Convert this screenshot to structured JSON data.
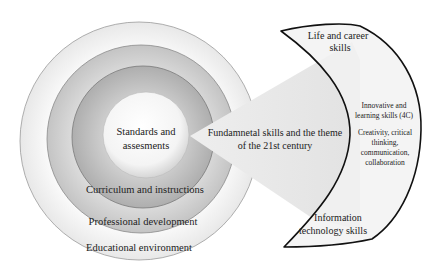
{
  "diagram": {
    "rings": [
      {
        "id": "educational-environment",
        "label": "Educational environment"
      },
      {
        "id": "professional-development",
        "label": "Professional development"
      },
      {
        "id": "curriculum",
        "label": "Curriculum and instructions"
      },
      {
        "id": "standards",
        "label_line1": "Standards and",
        "label_line2": "assesments"
      }
    ],
    "wedge": {
      "label_line1": "Fundamnetal skills and the theme",
      "label_line2": "of the 21st century"
    },
    "crescent": {
      "top_line1": "Life and career",
      "top_line2": "skills",
      "middle_heading_line1": "Innovative and",
      "middle_heading_line2": "learning skills (4C)",
      "middle_body_line1": "Creativity, critical",
      "middle_body_line2": "thinking,",
      "middle_body_line3": "communication,",
      "middle_body_line4": "collaboration",
      "bottom_line1": "Information",
      "bottom_line2": "technology skills"
    },
    "colors": {
      "outer_ring": "#f4f4f4",
      "ring2": "#cfcfcf",
      "ring3": "#b9b9b9",
      "inner": "#f7f7f7",
      "wedge": "#e6e6e6",
      "crescent_fill": "#f3f3f3",
      "outline": "#111111"
    }
  }
}
